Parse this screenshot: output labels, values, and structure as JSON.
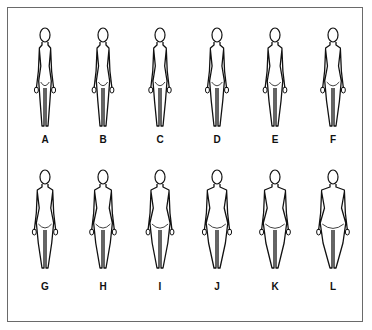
{
  "figure": {
    "type": "figure rating scale (female body silhouettes)",
    "rows": [
      {
        "figures": [
          {
            "label": "A",
            "width": 0.7,
            "cx": 45
          },
          {
            "label": "B",
            "width": 0.74,
            "cx": 103
          },
          {
            "label": "C",
            "width": 0.78,
            "cx": 160
          },
          {
            "label": "D",
            "width": 0.82,
            "cx": 217
          },
          {
            "label": "E",
            "width": 0.86,
            "cx": 275
          },
          {
            "label": "F",
            "width": 0.92,
            "cx": 333
          }
        ]
      },
      {
        "figures": [
          {
            "label": "G",
            "width": 0.96,
            "cx": 45
          },
          {
            "label": "H",
            "width": 1.04,
            "cx": 103
          },
          {
            "label": "I",
            "width": 1.12,
            "cx": 160
          },
          {
            "label": "J",
            "width": 1.2,
            "cx": 217
          },
          {
            "label": "K",
            "width": 1.3,
            "cx": 275
          },
          {
            "label": "L",
            "width": 1.42,
            "cx": 333
          }
        ]
      }
    ],
    "line_color": "#111111",
    "frame_color": "#6a6a6a"
  }
}
